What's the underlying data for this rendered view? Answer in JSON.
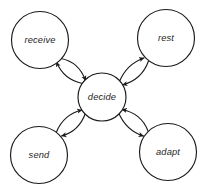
{
  "diagram": {
    "type": "cycle-hub-and-spoke",
    "background_color": "#ffffff",
    "stroke_color": "#1a1a1a",
    "text_color": "#262626",
    "hub": {
      "id": "decide",
      "label": "decide",
      "cx": 102,
      "cy": 97,
      "r": 24
    },
    "nodes": [
      {
        "id": "receive",
        "label": "receive",
        "cx": 40,
        "cy": 40,
        "r": 28.5,
        "position": "top-left"
      },
      {
        "id": "rest",
        "label": "rest",
        "cx": 166,
        "cy": 38,
        "r": 28.5,
        "position": "top-right"
      },
      {
        "id": "send",
        "label": "send",
        "cx": 39,
        "cy": 155,
        "r": 28.5,
        "position": "bottom-left"
      },
      {
        "id": "adapt",
        "label": "adapt",
        "cx": 168,
        "cy": 152,
        "r": 28.5,
        "position": "bottom-right"
      }
    ],
    "edges": [
      {
        "id": "receive-to-decide",
        "from": "receive",
        "to": "decide",
        "style": "curved-arrow",
        "arrowhead": "end"
      },
      {
        "id": "decide-to-receive",
        "from": "decide",
        "to": "receive",
        "style": "curved-arrow",
        "arrowhead": "end"
      },
      {
        "id": "rest-to-decide",
        "from": "rest",
        "to": "decide",
        "style": "curved-arrow",
        "arrowhead": "end"
      },
      {
        "id": "decide-to-rest",
        "from": "decide",
        "to": "rest",
        "style": "curved-arrow",
        "arrowhead": "end"
      },
      {
        "id": "send-to-decide",
        "from": "send",
        "to": "decide",
        "style": "curved-arrow",
        "arrowhead": "end"
      },
      {
        "id": "decide-to-send",
        "from": "decide",
        "to": "send",
        "style": "curved-arrow",
        "arrowhead": "end"
      },
      {
        "id": "adapt-to-decide",
        "from": "adapt",
        "to": "decide",
        "style": "curved-arrow",
        "arrowhead": "end"
      },
      {
        "id": "decide-to-adapt",
        "from": "decide",
        "to": "adapt",
        "style": "curved-arrow",
        "arrowhead": "end"
      }
    ]
  }
}
